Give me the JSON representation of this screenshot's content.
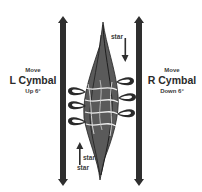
{
  "diagram": {
    "left_cymbal": {
      "line1": "Move",
      "line2": "L Cymbal",
      "line3": "Up 6°",
      "direction": "up"
    },
    "right_cymbal": {
      "line1": "Move",
      "line2": "R Cymbal",
      "line3": "Down 6°",
      "direction": "down"
    },
    "top_marker": {
      "label": "star",
      "arrow": "down-arrow-icon"
    },
    "bottom_marker": {
      "label_start": "start",
      "label_star": "star",
      "arrow": "up-arrow-icon"
    },
    "colors": {
      "bar": "#2e2e2e",
      "text": "#3a3a3a",
      "background": "#ffffff"
    }
  }
}
